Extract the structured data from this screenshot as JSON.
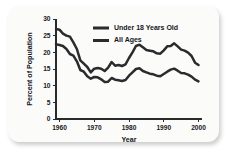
{
  "chart_data": {
    "type": "line",
    "title": "",
    "xlabel": "Year",
    "ylabel": "Percent of Population",
    "xlim": [
      1959,
      2001
    ],
    "ylim": [
      0,
      30
    ],
    "grid": false,
    "legend_position": "top-center",
    "xticks": [
      1960,
      1970,
      1980,
      1990,
      2000
    ],
    "xtick_labels": [
      "1960",
      "1970",
      "1980",
      "1990",
      "2000"
    ],
    "yticks": [
      0,
      5,
      10,
      15,
      20,
      25,
      30
    ],
    "ytick_labels": [
      "0",
      "5",
      "10",
      "15",
      "20",
      "25",
      "30"
    ],
    "x": [
      1959,
      1960,
      1961,
      1962,
      1963,
      1964,
      1965,
      1966,
      1967,
      1968,
      1969,
      1970,
      1971,
      1972,
      1973,
      1974,
      1975,
      1976,
      1977,
      1978,
      1979,
      1980,
      1981,
      1982,
      1983,
      1984,
      1985,
      1986,
      1987,
      1988,
      1989,
      1990,
      1991,
      1992,
      1993,
      1994,
      1995,
      1996,
      1997,
      1998,
      1999,
      2000
    ],
    "series": [
      {
        "name": "Under 18 Years Old",
        "color": "#2b2b2e",
        "values": [
          27.0,
          26.8,
          25.6,
          25.0,
          24.7,
          23.0,
          21.0,
          17.6,
          16.6,
          15.6,
          14.0,
          15.1,
          15.3,
          15.1,
          14.4,
          15.4,
          17.1,
          16.0,
          16.2,
          15.9,
          16.4,
          18.3,
          20.0,
          21.9,
          22.3,
          21.5,
          20.7,
          20.5,
          20.3,
          19.7,
          19.6,
          20.6,
          21.8,
          21.9,
          22.7,
          21.8,
          20.8,
          20.5,
          19.9,
          18.9,
          16.9,
          16.2
        ],
        "style": "solid"
      },
      {
        "name": "All Ages",
        "color": "#2b2b2e",
        "values": [
          22.4,
          22.2,
          21.9,
          21.0,
          19.5,
          19.0,
          17.3,
          14.7,
          14.2,
          12.8,
          12.1,
          12.6,
          12.5,
          11.9,
          11.1,
          11.2,
          12.3,
          11.8,
          11.6,
          11.4,
          11.7,
          13.0,
          14.0,
          15.0,
          15.2,
          14.4,
          14.0,
          13.6,
          13.4,
          13.0,
          12.8,
          13.5,
          14.2,
          14.8,
          15.1,
          14.5,
          13.8,
          13.7,
          13.3,
          12.7,
          11.8,
          11.3
        ],
        "style": "solid"
      }
    ],
    "legend": [
      {
        "label": "Under 18 Years Old"
      },
      {
        "label": "All Ages"
      }
    ]
  }
}
